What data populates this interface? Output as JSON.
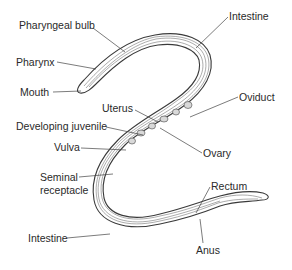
{
  "diagram": {
    "labels": {
      "pharyngeal_bulb": "Pharyngeal bulb",
      "pharynx": "Pharynx",
      "mouth": "Mouth",
      "intestine_top": "Intestine",
      "uterus": "Uterus",
      "oviduct": "Oviduct",
      "developing_juvenile": "Developing juvenile",
      "ovary": "Ovary",
      "vulva": "Vulva",
      "seminal_receptacle_line1": "Seminal",
      "seminal_receptacle_line2": "receptacle",
      "rectum": "Rectum",
      "intestine_bottom": "Intestine",
      "anus": "Anus"
    },
    "colors": {
      "line": "#3a3a3a",
      "text": "#2a2a2a",
      "background": "#ffffff"
    }
  }
}
